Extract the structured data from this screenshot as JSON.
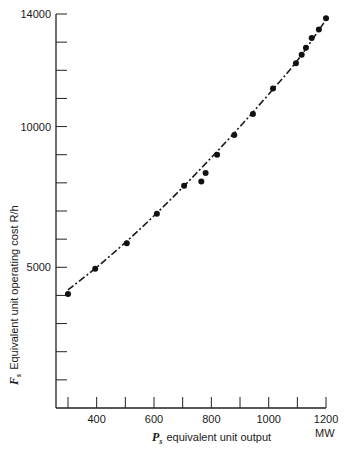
{
  "chart_data": {
    "type": "scatter",
    "title": "",
    "xlabel": "P_s equivalent unit output",
    "xlabel_symbol": "P",
    "xlabel_subscript": "s",
    "xlabel_text": "equivalent unit output",
    "xunit": "MW",
    "ylabel": "F_s Equivalent unit operating cost R/h",
    "ylabel_symbol": "F",
    "ylabel_subscript": "s",
    "ylabel_text": "Equivalent unit operating cost R/h",
    "xlim": [
      260,
      1200
    ],
    "ylim": [
      0,
      14000
    ],
    "x_ticks": [
      300,
      400,
      500,
      600,
      700,
      800,
      900,
      1000,
      1100,
      1200
    ],
    "x_tick_labels": [
      "400",
      "600",
      "800",
      "1000",
      "1200"
    ],
    "x_tick_label_values": [
      400,
      600,
      800,
      1000,
      1200
    ],
    "y_ticks": [
      1000,
      2000,
      3000,
      4000,
      5000,
      6000,
      7000,
      8000,
      9000,
      10000,
      11000,
      12000,
      13000,
      14000
    ],
    "y_tick_labels": [
      "5000",
      "10000",
      "14000"
    ],
    "y_tick_label_values": [
      5000,
      10000,
      14000
    ],
    "grid": false,
    "legend": null,
    "series": [
      {
        "name": "Data points",
        "style": "markers",
        "x": [
          300,
          395,
          505,
          610,
          705,
          765,
          780,
          820,
          880,
          945,
          1015,
          1095,
          1115,
          1130,
          1150,
          1175,
          1200
        ],
        "y": [
          4050,
          4950,
          5850,
          6900,
          7900,
          8050,
          8350,
          9000,
          9700,
          10450,
          11350,
          12250,
          12550,
          12800,
          13150,
          13450,
          13850
        ]
      },
      {
        "name": "Fitted curve",
        "style": "dash-dot line",
        "x": [
          300,
          400,
          500,
          600,
          700,
          800,
          900,
          1000,
          1100,
          1200
        ],
        "y": [
          4200,
          5000,
          5880,
          6830,
          7840,
          8900,
          10000,
          11150,
          12350,
          13800
        ]
      }
    ]
  }
}
